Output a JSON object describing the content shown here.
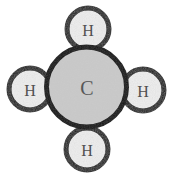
{
  "diagram": {
    "formula": "CH4",
    "background_color": "#ffffff",
    "bond_outline_color": "#141414",
    "carbon": {
      "symbol": "C",
      "name": "carbon-atom",
      "cx": 86.5,
      "cy": 87,
      "r": 40,
      "fill": "#c9c9c9",
      "stroke": "#141414",
      "stroke_width": 5,
      "label_font_size": 20
    },
    "hydrogens": [
      {
        "symbol": "H",
        "name": "hydrogen-atom-top",
        "position": "top",
        "cx": 88,
        "cy": 29,
        "r": 21,
        "fill": "#ededed",
        "stroke": "#141414",
        "stroke_width": 5,
        "label_font_size": 16
      },
      {
        "symbol": "H",
        "name": "hydrogen-atom-left",
        "position": "left",
        "cx": 30,
        "cy": 89,
        "r": 21,
        "fill": "#ededed",
        "stroke": "#141414",
        "stroke_width": 5,
        "label_font_size": 16
      },
      {
        "symbol": "H",
        "name": "hydrogen-atom-right",
        "position": "right",
        "cx": 143,
        "cy": 90,
        "r": 21,
        "fill": "#ededed",
        "stroke": "#141414",
        "stroke_width": 5,
        "label_font_size": 16
      },
      {
        "symbol": "H",
        "name": "hydrogen-atom-bottom",
        "position": "bottom",
        "cx": 87,
        "cy": 149,
        "r": 21,
        "fill": "#ededed",
        "stroke": "#141414",
        "stroke_width": 5,
        "label_font_size": 16
      }
    ]
  }
}
